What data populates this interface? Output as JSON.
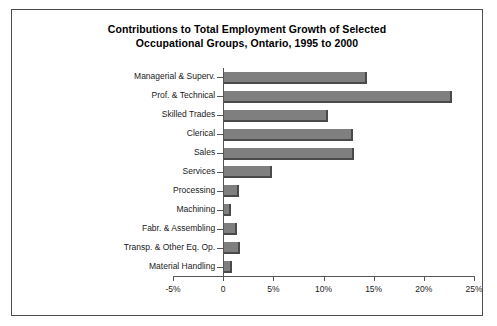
{
  "chart_data": {
    "type": "bar",
    "orientation": "horizontal",
    "title": "Contributions to Total Employment Growth of Selected Occupational Groups, Ontario, 1995 to 2000",
    "title_lines": [
      "Contributions to Total Employment Growth of Selected",
      "Occupational Groups, Ontario, 1995 to 2000"
    ],
    "xlabel": "",
    "ylabel": "",
    "categories": [
      "Managerial & Superv.",
      "Prof. & Technical",
      "Skilled Trades",
      "Clerical",
      "Sales",
      "Services",
      "Processing",
      "Machining",
      "Fabr. & Assembling",
      "Transp. & Other Eq. Op.",
      "Material Handling"
    ],
    "values": [
      14.0,
      22.5,
      10.2,
      12.6,
      12.7,
      4.6,
      1.3,
      0.5,
      1.1,
      1.4,
      0.6
    ],
    "value_unit": "%",
    "xlim": [
      -5,
      25
    ],
    "xticks": [
      -5,
      0,
      5,
      10,
      15,
      20,
      25
    ],
    "xtick_labels": [
      "-5%",
      "0",
      "5%",
      "10%",
      "15%",
      "20%",
      "25%"
    ],
    "grid": false,
    "legend": false,
    "series_color": "#7f7f7f",
    "bar_shadow_color": "#4a4a4a",
    "axis_color": "#555555",
    "frame_color": "#4d4d4d",
    "background_color": "#ffffff"
  }
}
